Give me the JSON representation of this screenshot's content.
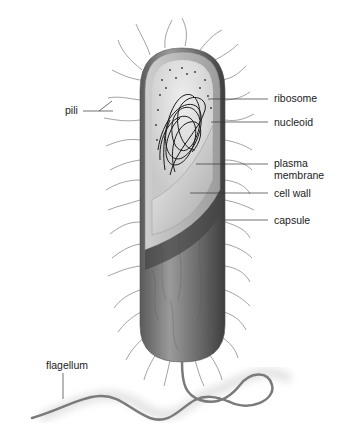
{
  "figure": {
    "labels": {
      "pili": "pili",
      "ribosome": "ribosome",
      "nucleoid": "nucleoid",
      "plasma_membrane_line1": "plasma",
      "plasma_membrane_line2": "membrane",
      "cell_wall": "cell wall",
      "capsule": "capsule",
      "flagellum": "flagellum"
    },
    "colors": {
      "background": "#ffffff",
      "capsule_body": "#6e6e6e",
      "cell_wall": "#bdbdbd",
      "cytoplasm": "#dedede",
      "nucleoid": "#1a1a1a",
      "pili": "#8a8a8a",
      "leader_lines": "#333333",
      "flagellum": "#7a7a7a"
    }
  }
}
